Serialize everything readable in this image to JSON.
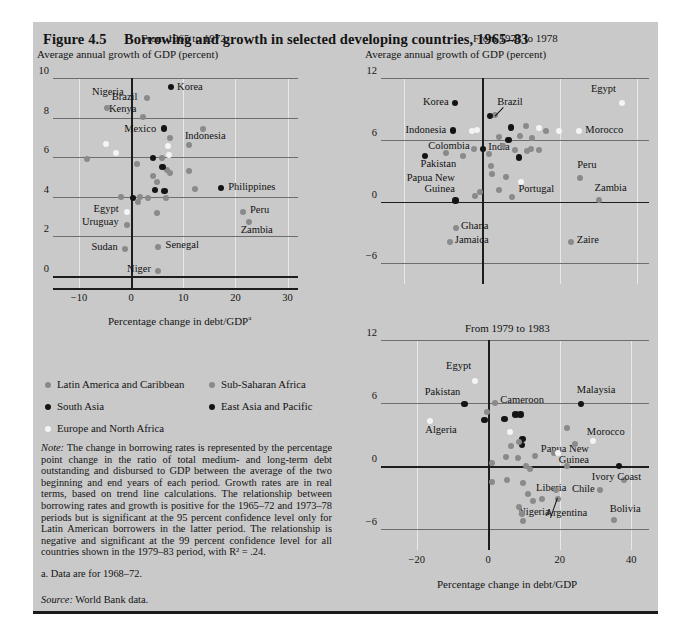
{
  "figure": {
    "number": "Figure 4.5",
    "title": "Borrowing and growth in selected developing countries, 1965–83"
  },
  "legend": {
    "items": [
      {
        "label": "Latin America and Caribbean",
        "color": "#8a8a8a",
        "key": "gray"
      },
      {
        "label": "Sub-Saharan Africa",
        "color": "#8a8a8a",
        "key": "gray"
      },
      {
        "label": "South Asia",
        "color": "#141414",
        "key": "black"
      },
      {
        "label": "East Asia and Pacific",
        "color": "#141414",
        "key": "black"
      },
      {
        "label": "Europe and North Africa",
        "color": "#f4f4f4",
        "key": "white"
      }
    ]
  },
  "note": {
    "label": "Note:",
    "text": " The change in borrowing rates is represented by the percentage point change in the ratio of total medium- and long-term debt outstanding and disbursed to GDP between the average of the two beginning and end years of each period. Growth rates are in real terms, based on trend line calculations. The relationship between borrowing rates and growth is positive for the 1965–72 and 1973–78 periods but is significant at the 95 percent confidence level only for Latin American borrowers in the latter period. The relationship is negative and significant at the 99 percent confidence level for all countries shown in the 1979–83 period, with R² = .24."
  },
  "footnote_a": "a. Data are for 1968–72.",
  "source": {
    "label": "Source:",
    "text": " World Bank data."
  },
  "chart_data": [
    {
      "id": "panel1",
      "type": "scatter",
      "title": "From 1965 to 1972",
      "ylabel": "Average annual growth of GDP (percent)",
      "xlabel": "Percentage change in debt/GDP",
      "xlabel_superscript": "a",
      "xlim": [
        -15,
        32
      ],
      "ylim": [
        -0.6,
        10
      ],
      "xticks": [
        -10,
        0,
        10,
        20,
        30
      ],
      "yticks": [
        0,
        2,
        4,
        6,
        8,
        10
      ],
      "grid": true,
      "points": [
        {
          "x": -4.6,
          "y": 8.5,
          "c": "gray",
          "label": "Nigeria",
          "lx": -7.5,
          "ly": 9.25,
          "anchor": "start"
        },
        {
          "x": 7.6,
          "y": 9.55,
          "c": "black",
          "label": "Korea",
          "lx": 8.8,
          "ly": 9.5,
          "anchor": "start"
        },
        {
          "x": 3.1,
          "y": 9.0,
          "c": "gray",
          "label": "Brazil",
          "lx": 1.2,
          "ly": 9.0,
          "anchor": "end"
        },
        {
          "x": 2.2,
          "y": 8.05,
          "c": "gray",
          "label": "Kenya",
          "lx": 1.0,
          "ly": 8.4,
          "anchor": "end"
        },
        {
          "x": 6.3,
          "y": 7.45,
          "c": "black",
          "label": "Mexico",
          "lx": 4.8,
          "ly": 7.4,
          "anchor": "end"
        },
        {
          "x": 13.7,
          "y": 7.45,
          "c": "gray",
          "label": "Indonesia",
          "lx": 10.3,
          "ly": 7.0,
          "anchor": "start"
        },
        {
          "x": 17.2,
          "y": 4.45,
          "c": "black",
          "label": "Philippines",
          "lx": 18.6,
          "ly": 4.45,
          "anchor": "start"
        },
        {
          "x": 21.4,
          "y": 3.25,
          "c": "gray",
          "label": "Peru",
          "lx": 22.8,
          "ly": 3.3,
          "anchor": "start"
        },
        {
          "x": 22.6,
          "y": 2.75,
          "c": "gray",
          "label": "Zambia",
          "lx": 21.0,
          "ly": 2.3,
          "anchor": "start"
        },
        {
          "x": -0.9,
          "y": 3.25,
          "c": "white",
          "label": "Egypt",
          "lx": -2.4,
          "ly": 3.35,
          "anchor": "end"
        },
        {
          "x": -0.9,
          "y": 2.6,
          "c": "gray",
          "label": "Uruguay",
          "lx": -2.4,
          "ly": 2.7,
          "anchor": "end"
        },
        {
          "x": -1.2,
          "y": 1.35,
          "c": "gray",
          "label": "Sudan",
          "lx": -2.6,
          "ly": 1.4,
          "anchor": "end"
        },
        {
          "x": 5.2,
          "y": 1.45,
          "c": "gray",
          "label": "Senegal",
          "lx": 6.6,
          "ly": 1.5,
          "anchor": "start"
        },
        {
          "x": 5.2,
          "y": 0.25,
          "c": "gray",
          "label": "Niger",
          "lx": 3.8,
          "ly": 0.3,
          "anchor": "end"
        },
        {
          "x": -4.9,
          "y": 6.65,
          "c": "white"
        },
        {
          "x": -3.0,
          "y": 6.2,
          "c": "white"
        },
        {
          "x": -8.4,
          "y": 5.9,
          "c": "gray"
        },
        {
          "x": -2.0,
          "y": 4.0,
          "c": "gray"
        },
        {
          "x": 0.4,
          "y": 3.95,
          "c": "black"
        },
        {
          "x": 1.7,
          "y": 4.0,
          "c": "gray"
        },
        {
          "x": 3.3,
          "y": 3.95,
          "c": "gray"
        },
        {
          "x": 1.3,
          "y": 3.75,
          "c": "gray"
        },
        {
          "x": 6.6,
          "y": 3.95,
          "c": "gray"
        },
        {
          "x": 6.4,
          "y": 4.3,
          "c": "black"
        },
        {
          "x": 4.6,
          "y": 4.35,
          "c": "black"
        },
        {
          "x": 5.0,
          "y": 4.75,
          "c": "gray"
        },
        {
          "x": 4.2,
          "y": 5.05,
          "c": "gray"
        },
        {
          "x": 7.5,
          "y": 5.2,
          "c": "gray"
        },
        {
          "x": 6.8,
          "y": 5.35,
          "c": "gray"
        },
        {
          "x": 11.0,
          "y": 5.3,
          "c": "gray"
        },
        {
          "x": 6.0,
          "y": 5.5,
          "c": "black"
        },
        {
          "x": 1.2,
          "y": 5.65,
          "c": "gray"
        },
        {
          "x": 4.2,
          "y": 5.95,
          "c": "black"
        },
        {
          "x": 5.9,
          "y": 5.95,
          "c": "gray"
        },
        {
          "x": 7.3,
          "y": 6.1,
          "c": "white"
        },
        {
          "x": 7.1,
          "y": 6.55,
          "c": "white"
        },
        {
          "x": 7.4,
          "y": 6.95,
          "c": "gray"
        },
        {
          "x": 11.0,
          "y": 6.6,
          "c": "gray"
        },
        {
          "x": 12.2,
          "y": 4.4,
          "c": "gray"
        },
        {
          "x": 5.0,
          "y": 3.2,
          "c": "gray"
        }
      ]
    },
    {
      "id": "panel2",
      "type": "scatter",
      "title": "From 1973 to 1978",
      "ylabel": "Average annual growth of GDP (percent)",
      "xlim": [
        -26,
        43
      ],
      "ylim": [
        -8,
        12
      ],
      "xticks": [],
      "yticks": [
        -6,
        0,
        6,
        12
      ],
      "grid": true,
      "points": [
        {
          "x": -7.0,
          "y": 9.6,
          "c": "black",
          "label": "Korea",
          "lx": -8.6,
          "ly": 9.6,
          "anchor": "end"
        },
        {
          "x": 36.0,
          "y": 9.6,
          "c": "white",
          "label": "Egypt",
          "lx": 34.5,
          "ly": 10.8,
          "anchor": "end"
        },
        {
          "x": -7.5,
          "y": 6.9,
          "c": "black",
          "label": "Indonesia",
          "lx": -9.2,
          "ly": 6.9,
          "anchor": "end"
        },
        {
          "x": 3.4,
          "y": 8.4,
          "c": "gray",
          "label": "Brazil",
          "lx": 3.9,
          "ly": 9.6,
          "anchor": "start",
          "leader": true
        },
        {
          "x": 25.0,
          "y": 6.9,
          "c": "white",
          "label": "Morocco",
          "lx": 26.6,
          "ly": 6.9,
          "anchor": "start"
        },
        {
          "x": -2.0,
          "y": 5.1,
          "c": "gray",
          "label": "Colombia",
          "lx": -3.2,
          "ly": 5.3,
          "anchor": "end"
        },
        {
          "x": 0.2,
          "y": 5.1,
          "c": "black",
          "label": "India",
          "lx": 1.6,
          "ly": 5.2,
          "anchor": "start"
        },
        {
          "x": -14.6,
          "y": 4.4,
          "c": "black",
          "label": "Pakistan",
          "lx": -15.8,
          "ly": 3.6,
          "anchor": "start"
        },
        {
          "x": -6.8,
          "y": 0.1,
          "c": "black",
          "label": "Papua New Guinea",
          "lx": -7.0,
          "ly": 2.2,
          "anchor": "mid2"
        },
        {
          "x": 10.0,
          "y": 1.9,
          "c": "white",
          "label": "Portugal",
          "lx": 9.4,
          "ly": 1.1,
          "anchor": "start"
        },
        {
          "x": 25.2,
          "y": 2.3,
          "c": "gray",
          "label": "Peru",
          "lx": 24.5,
          "ly": 3.5,
          "anchor": "start"
        },
        {
          "x": 30.0,
          "y": 0.2,
          "c": "gray",
          "label": "Zambia",
          "lx": 29.0,
          "ly": 1.2,
          "anchor": "start"
        },
        {
          "x": -6.6,
          "y": -2.6,
          "c": "gray",
          "label": "Ghana",
          "lx": -5.4,
          "ly": -2.5,
          "anchor": "start"
        },
        {
          "x": -8.2,
          "y": -3.9,
          "c": "gray",
          "label": "Jamaica",
          "lx": -7.0,
          "ly": -3.8,
          "anchor": "start"
        },
        {
          "x": 23.0,
          "y": -3.9,
          "c": "gray",
          "label": "Zaire",
          "lx": 24.4,
          "ly": -3.8,
          "anchor": "start"
        },
        {
          "x": -1.2,
          "y": 7.0,
          "c": "white"
        },
        {
          "x": -2.6,
          "y": 6.9,
          "c": "white"
        },
        {
          "x": 2.0,
          "y": 8.3,
          "c": "black"
        },
        {
          "x": 7.4,
          "y": 7.2,
          "c": "black"
        },
        {
          "x": 11.4,
          "y": 7.3,
          "c": "gray"
        },
        {
          "x": 14.8,
          "y": 7.1,
          "c": "white"
        },
        {
          "x": 16.4,
          "y": 6.9,
          "c": "gray"
        },
        {
          "x": 19.8,
          "y": 6.9,
          "c": "white"
        },
        {
          "x": 4.4,
          "y": 6.3,
          "c": "gray"
        },
        {
          "x": 6.8,
          "y": 6.0,
          "c": "black"
        },
        {
          "x": 9.8,
          "y": 6.4,
          "c": "gray"
        },
        {
          "x": 12.8,
          "y": 6.2,
          "c": "gray"
        },
        {
          "x": 5.4,
          "y": 5.4,
          "c": "gray"
        },
        {
          "x": 8.4,
          "y": 5.0,
          "c": "gray"
        },
        {
          "x": 11.6,
          "y": 4.9,
          "c": "gray"
        },
        {
          "x": 12.6,
          "y": 5.1,
          "c": "gray"
        },
        {
          "x": 14.6,
          "y": 5.0,
          "c": "gray"
        },
        {
          "x": 9.6,
          "y": 4.3,
          "c": "black"
        },
        {
          "x": 1.8,
          "y": 4.6,
          "c": "gray"
        },
        {
          "x": -5.0,
          "y": 4.4,
          "c": "gray"
        },
        {
          "x": -9.2,
          "y": 4.7,
          "c": "gray"
        },
        {
          "x": 2.4,
          "y": 3.5,
          "c": "gray"
        },
        {
          "x": 2.6,
          "y": 2.7,
          "c": "gray"
        },
        {
          "x": 6.2,
          "y": 2.4,
          "c": "gray"
        },
        {
          "x": 4.4,
          "y": 1.1,
          "c": "gray"
        },
        {
          "x": -1.8,
          "y": 0.5,
          "c": "gray"
        },
        {
          "x": -0.6,
          "y": 0.9,
          "c": "gray"
        },
        {
          "x": 7.6,
          "y": 0.4,
          "c": "gray"
        }
      ]
    },
    {
      "id": "panel3",
      "type": "scatter",
      "title": "From 1979 to 1983",
      "xlabel": "Percentage change in debt/GDP",
      "xlim": [
        -30,
        45
      ],
      "ylim": [
        -8,
        12
      ],
      "xticks": [
        -20,
        0,
        20,
        40
      ],
      "yticks": [
        -6,
        0,
        6,
        12
      ],
      "grid": true,
      "points": [
        {
          "x": -3.6,
          "y": 8.1,
          "c": "white",
          "label": "Egypt",
          "lx": -4.8,
          "ly": 9.4,
          "anchor": "end"
        },
        {
          "x": -6.6,
          "y": 5.9,
          "c": "black",
          "label": "Pakistan",
          "lx": -7.8,
          "ly": 7.0,
          "anchor": "end"
        },
        {
          "x": 2.0,
          "y": 6.0,
          "c": "gray",
          "label": "Cameroon",
          "lx": 3.4,
          "ly": 6.2,
          "anchor": "start"
        },
        {
          "x": 26.0,
          "y": 5.9,
          "c": "black",
          "label": "Malaysia",
          "lx": 24.8,
          "ly": 7.1,
          "anchor": "start"
        },
        {
          "x": -16.4,
          "y": 4.3,
          "c": "white",
          "label": "Algeria",
          "lx": -17.6,
          "ly": 3.3,
          "anchor": "start"
        },
        {
          "x": 29.4,
          "y": 2.4,
          "c": "white",
          "label": "Morocco",
          "lx": 27.6,
          "ly": 3.1,
          "anchor": "start"
        },
        {
          "x": 36.6,
          "y": 0.0,
          "c": "black",
          "label": "Papua New Guinea",
          "lx": 28.2,
          "ly": 1.5,
          "anchor": "mid3"
        },
        {
          "x": 38.0,
          "y": -1.3,
          "c": "gray",
          "label": "Ivory Coast",
          "lx": 29.0,
          "ly": -1.1,
          "anchor": "start"
        },
        {
          "x": 31.4,
          "y": -2.3,
          "c": "gray",
          "label": "Chile",
          "lx": 29.8,
          "ly": -2.3,
          "anchor": "end"
        },
        {
          "x": 35.2,
          "y": -5.1,
          "c": "gray",
          "label": "Bolivia",
          "lx": 34.0,
          "ly": -4.2,
          "anchor": "start"
        },
        {
          "x": 15.0,
          "y": -3.1,
          "c": "gray",
          "label": "Liberia",
          "lx": 13.4,
          "ly": -2.2,
          "anchor": "start"
        },
        {
          "x": 19.6,
          "y": -3.1,
          "c": "gray",
          "label": "Argentina",
          "lx": 16.0,
          "ly": -4.6,
          "anchor": "start",
          "leader": true
        },
        {
          "x": 9.6,
          "y": -5.2,
          "c": "gray",
          "label": "Nigeria",
          "lx": 8.4,
          "ly": -4.5,
          "anchor": "start"
        },
        {
          "x": -0.4,
          "y": 5.1,
          "c": "gray"
        },
        {
          "x": -1.0,
          "y": 4.4,
          "c": "black"
        },
        {
          "x": 4.6,
          "y": 4.5,
          "c": "black"
        },
        {
          "x": 7.6,
          "y": 4.9,
          "c": "black"
        },
        {
          "x": 9.0,
          "y": 4.9,
          "c": "black"
        },
        {
          "x": 6.2,
          "y": 3.2,
          "c": "white"
        },
        {
          "x": 9.6,
          "y": 2.6,
          "c": "black"
        },
        {
          "x": 9.4,
          "y": 2.0,
          "c": "black"
        },
        {
          "x": 8.6,
          "y": 2.3,
          "c": "gray"
        },
        {
          "x": 6.4,
          "y": 1.9,
          "c": "gray"
        },
        {
          "x": 22.0,
          "y": 3.6,
          "c": "gray"
        },
        {
          "x": 24.4,
          "y": 2.1,
          "c": "gray"
        },
        {
          "x": 5.0,
          "y": 0.9,
          "c": "gray"
        },
        {
          "x": 8.2,
          "y": 0.8,
          "c": "gray"
        },
        {
          "x": 13.2,
          "y": 1.0,
          "c": "gray"
        },
        {
          "x": 18.4,
          "y": 1.2,
          "c": "gray"
        },
        {
          "x": 19.4,
          "y": 1.2,
          "c": "white"
        },
        {
          "x": 1.2,
          "y": 0.3,
          "c": "gray"
        },
        {
          "x": 10.6,
          "y": 0.0,
          "c": "gray"
        },
        {
          "x": 11.8,
          "y": -0.3,
          "c": "gray"
        },
        {
          "x": 22.0,
          "y": 0.0,
          "c": "gray"
        },
        {
          "x": 1.0,
          "y": -1.5,
          "c": "gray"
        },
        {
          "x": 5.4,
          "y": -1.3,
          "c": "gray"
        },
        {
          "x": 9.6,
          "y": -1.6,
          "c": "gray"
        },
        {
          "x": 11.0,
          "y": -2.7,
          "c": "gray"
        },
        {
          "x": 8.6,
          "y": -3.9,
          "c": "gray"
        },
        {
          "x": 9.4,
          "y": -4.6,
          "c": "gray"
        },
        {
          "x": 12.6,
          "y": -3.3,
          "c": "gray"
        },
        {
          "x": 19.0,
          "y": -2.3,
          "c": "gray"
        }
      ]
    }
  ]
}
